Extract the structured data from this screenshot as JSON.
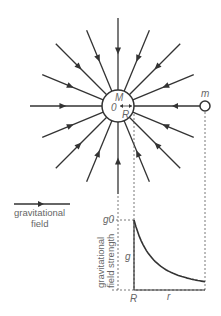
{
  "diagram": {
    "mass_label": "M",
    "center_label": "0",
    "radius_label": "R",
    "test_mass_label": "m",
    "field_line_count": 16,
    "legend": {
      "line1": "gravitational",
      "line2": "field"
    },
    "graph": {
      "y_top_label": "g0",
      "y_mid_label": "g",
      "y_axis_title_line1": "gravitational",
      "y_axis_title_line2": "field strength",
      "x_start_label": "R",
      "x_label": "r"
    }
  },
  "colors": {
    "line": "#333333",
    "text": "#666666"
  }
}
